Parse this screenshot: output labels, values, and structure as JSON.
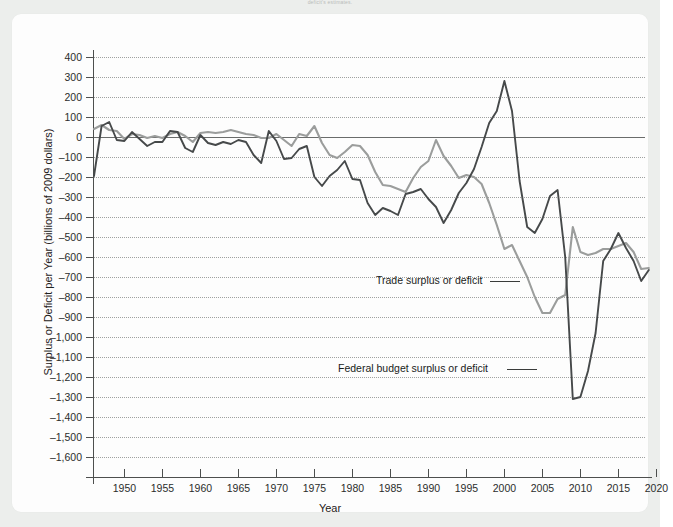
{
  "page": {
    "top_caption": "deficit's estimates."
  },
  "chart_data": {
    "type": "line",
    "title": "",
    "xlabel": "Year",
    "ylabel": "Surplus or Deficit per Year (billions of 2009 dollars)",
    "xlim": [
      1946,
      2021
    ],
    "ylim": [
      -1600,
      400
    ],
    "ytick_step": 100,
    "xtick_step": 5,
    "grid": true,
    "legend_position": "inline-annotations",
    "xticks": [
      1950,
      1955,
      1960,
      1965,
      1970,
      1975,
      1980,
      1985,
      1990,
      1995,
      2000,
      2005,
      2010,
      2015,
      2020
    ],
    "ytick_labels": [
      "400",
      "300",
      "200",
      "100",
      "0",
      "-100",
      "-200",
      "-300",
      "-400",
      "-500",
      "-600",
      "-700",
      "-800",
      "-900",
      "-1,000",
      "-1,100",
      "-1,200",
      "-1,300",
      "-1,400",
      "-1,500",
      "-1,600"
    ],
    "yticks": [
      400,
      300,
      200,
      100,
      0,
      -100,
      -200,
      -300,
      -400,
      -500,
      -600,
      -700,
      -800,
      -900,
      -1000,
      -1100,
      -1200,
      -1300,
      -1400,
      -1500,
      -1600
    ],
    "annotations": [
      {
        "name": "trade-annotation",
        "text": "Trade surplus or deficit",
        "x": 1998.0,
        "y": -670
      },
      {
        "name": "budget-annotation",
        "text": "Federal budget surplus or deficit",
        "x": 2000.2,
        "y": -1110
      }
    ],
    "series": [
      {
        "name": "Federal budget surplus or deficit",
        "color": "#46494a",
        "x": [
          1946,
          1947,
          1948,
          1949,
          1950,
          1951,
          1952,
          1953,
          1954,
          1955,
          1956,
          1957,
          1958,
          1959,
          1960,
          1961,
          1962,
          1963,
          1964,
          1965,
          1966,
          1967,
          1968,
          1969,
          1970,
          1971,
          1972,
          1973,
          1974,
          1975,
          1976,
          1977,
          1978,
          1979,
          1980,
          1981,
          1982,
          1983,
          1984,
          1985,
          1986,
          1987,
          1988,
          1989,
          1990,
          1991,
          1992,
          1993,
          1994,
          1995,
          1996,
          1997,
          1998,
          1999,
          2000,
          2001,
          2002,
          2003,
          2004,
          2005,
          2006,
          2007,
          2008,
          2009,
          2010,
          2011,
          2012,
          2013,
          2014,
          2015,
          2016,
          2017,
          2018,
          2019
        ],
        "values": [
          -195,
          55,
          75,
          -15,
          -20,
          25,
          -10,
          -45,
          -25,
          -25,
          30,
          25,
          -55,
          -75,
          10,
          -30,
          -40,
          -25,
          -35,
          -15,
          -25,
          -90,
          -130,
          30,
          -20,
          -110,
          -105,
          -60,
          -45,
          -200,
          -245,
          -195,
          -165,
          -120,
          -210,
          -215,
          -330,
          -390,
          -355,
          -370,
          -390,
          -285,
          -275,
          -260,
          -310,
          -350,
          -430,
          -365,
          -280,
          -230,
          -160,
          -50,
          70,
          130,
          280,
          130,
          -220,
          -450,
          -480,
          -410,
          -295,
          -265,
          -600,
          -1310,
          -1300,
          -1170,
          -980,
          -620,
          -560,
          -480,
          -555,
          -620,
          -720,
          -665
        ]
      },
      {
        "name": "Trade surplus or deficit",
        "color": "#9b9d9c",
        "x": [
          1946,
          1947,
          1948,
          1949,
          1950,
          1951,
          1952,
          1953,
          1954,
          1955,
          1956,
          1957,
          1958,
          1959,
          1960,
          1961,
          1962,
          1963,
          1964,
          1965,
          1966,
          1967,
          1968,
          1969,
          1970,
          1971,
          1972,
          1973,
          1974,
          1975,
          1976,
          1977,
          1978,
          1979,
          1980,
          1981,
          1982,
          1983,
          1984,
          1985,
          1986,
          1987,
          1988,
          1989,
          1990,
          1991,
          1992,
          1993,
          1994,
          1995,
          1996,
          1997,
          1998,
          1999,
          2000,
          2001,
          2002,
          2003,
          2004,
          2005,
          2006,
          2007,
          2008,
          2009,
          2010,
          2011,
          2012,
          2013,
          2014,
          2015,
          2016,
          2017,
          2018,
          2019
        ],
        "values": [
          40,
          60,
          35,
          30,
          -10,
          15,
          10,
          -5,
          5,
          -5,
          15,
          25,
          5,
          -25,
          20,
          25,
          20,
          25,
          35,
          25,
          15,
          10,
          -5,
          -5,
          15,
          -15,
          -45,
          15,
          5,
          55,
          -30,
          -90,
          -105,
          -75,
          -40,
          -45,
          -90,
          -175,
          -240,
          -245,
          -260,
          -275,
          -205,
          -150,
          -120,
          -15,
          -95,
          -145,
          -205,
          -190,
          -200,
          -235,
          -330,
          -440,
          -560,
          -540,
          -620,
          -700,
          -800,
          -880,
          -880,
          -810,
          -790,
          -450,
          -575,
          -590,
          -580,
          -560,
          -560,
          -545,
          -530,
          -575,
          -660,
          -655
        ]
      }
    ]
  }
}
